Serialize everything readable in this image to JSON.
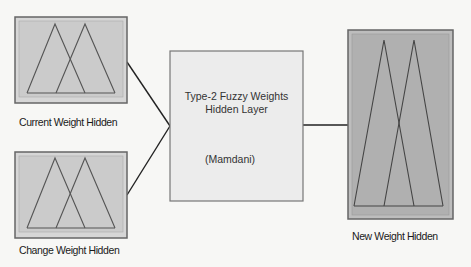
{
  "diagram": {
    "inputs": [
      {
        "label": "Current Weight Hidden"
      },
      {
        "label": "Change Weight Hidden"
      }
    ],
    "system": {
      "title_line1": "Type-2 Fuzzy Weights",
      "title_line2": "Hidden Layer",
      "method": "(Mamdani)"
    },
    "output": {
      "label": "New Weight Hidden"
    },
    "colors": {
      "input_box_fill": "#cfcfcf",
      "system_box_fill": "#ececec",
      "output_box_fill": "#b3b3b3",
      "line": "#222222"
    }
  }
}
